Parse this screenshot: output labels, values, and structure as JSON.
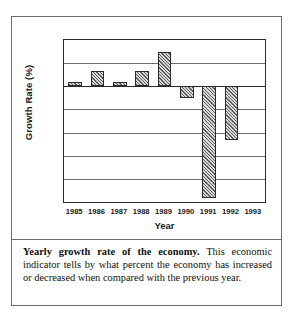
{
  "figure": {
    "caption_lead": "Yearly growth rate of the economy.",
    "caption_body": " This economic indicator tells by what percent the economy has increased or decreased when compared with the previous year."
  },
  "chart_data": {
    "type": "bar",
    "title": "",
    "xlabel": "Year",
    "ylabel": "Growth Rate (%)",
    "categories": [
      "1985",
      "1986",
      "1987",
      "1988",
      "1989",
      "1990",
      "1991",
      "1992",
      "1993"
    ],
    "values": [
      0.5,
      2.0,
      0.5,
      2.0,
      4.5,
      -1.5,
      -14.5,
      -7.0,
      0
    ],
    "ylim": [
      -15,
      6
    ],
    "yticks": [
      6,
      3,
      0,
      -3,
      -6,
      -9,
      -12,
      -15
    ],
    "ytick_labels": [
      "6",
      "3",
      "0",
      "-3",
      "-6",
      "-9",
      "-12",
      "-15"
    ],
    "grid": true,
    "legend": "none",
    "bar_fill": "#d9d9d9",
    "bar_edge": "#2b2b2b"
  }
}
